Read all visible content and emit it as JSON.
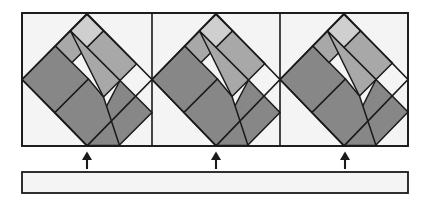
{
  "figure": {
    "canvas": {
      "width": 428,
      "height": 203,
      "background": "#ffffff"
    },
    "colors": {
      "outline": "#1a1a1a",
      "panel_fill": "#f4f4f4",
      "light_gray": "#cfcfcf",
      "medium_gray": "#a8a8a8",
      "dark_gray": "#878787",
      "bar_fill": "#f4f4f4",
      "arrow": "#1a1a1a"
    },
    "strip": {
      "label": "tile-strip",
      "x": 22,
      "y": 13,
      "width": 386,
      "height": 133,
      "stroke_width": 1.6,
      "dividers": [
        152,
        280
      ]
    },
    "tiles": [
      {
        "name": "tile-1",
        "center_x": 87,
        "center_y": 79.5,
        "half_width": 65,
        "half_height": 66,
        "apex_top_y": 13,
        "apex_bottom_y": 146
      },
      {
        "name": "tile-2",
        "center_x": 216,
        "center_y": 79.5,
        "half_width": 64,
        "half_height": 66,
        "apex_top_y": 13,
        "apex_bottom_y": 146
      },
      {
        "name": "tile-3",
        "center_x": 345,
        "center_y": 79.5,
        "half_width": 63,
        "half_height": 66,
        "apex_top_y": 13,
        "apex_bottom_y": 146
      }
    ],
    "tile_pieces": [
      {
        "name": "center-square",
        "shade": "medium_gray"
      },
      {
        "name": "pinwheel-piece-top",
        "shade": "light_gray"
      },
      {
        "name": "pinwheel-piece-right",
        "shade": "medium_gray"
      },
      {
        "name": "pinwheel-piece-bottom",
        "shade": "dark_gray"
      },
      {
        "name": "pinwheel-piece-left",
        "shade": "dark_gray"
      },
      {
        "name": "pinwheel-piece-upper-left",
        "shade": "medium_gray"
      },
      {
        "name": "pinwheel-piece-lower-right",
        "shade": "dark_gray"
      }
    ],
    "arrows": [
      {
        "name": "arrow-1",
        "x": 87,
        "tip_y": 152,
        "tail_y": 169,
        "direction": "up"
      },
      {
        "name": "arrow-2",
        "x": 216,
        "tip_y": 152,
        "tail_y": 169,
        "direction": "up"
      },
      {
        "name": "arrow-3",
        "x": 345,
        "tip_y": 152,
        "tail_y": 169,
        "direction": "up"
      }
    ],
    "bottom_bar": {
      "name": "bottom-bar",
      "x": 22,
      "y": 172,
      "width": 386,
      "height": 21,
      "stroke_width": 1.6
    },
    "caption": ""
  }
}
